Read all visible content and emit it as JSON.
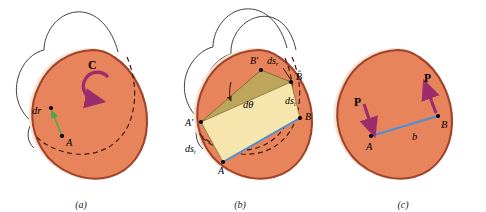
{
  "figure": {
    "background": "#ffffff"
  },
  "colors": {
    "body_fill": "#E8845C",
    "body_edge": "#A0432A",
    "body_highlight": "#F7E3D2",
    "outline_curve": "#2B2B2B",
    "dashed_curve": "#3A1A10",
    "arrow_purple": "#9B2D6F",
    "arrow_green": "#4CA64C",
    "line_blue": "#4B8FD6",
    "rect_fill": "#F7E5AE",
    "rect_fill_rotated": "#B8A85C",
    "point_black": "#000000",
    "caption_text": "#1a1a1a"
  },
  "panels": [
    {
      "id": "a",
      "caption": "(a)",
      "labels": [
        {
          "name": "rotation-label-c",
          "text": "C",
          "style": "bold",
          "x": 94,
          "y": 66
        },
        {
          "name": "dr-label",
          "text": "dr",
          "style": "italic-bold-r",
          "x": 36,
          "y": 114
        },
        {
          "name": "point-a-label",
          "text": "A",
          "style": "italic",
          "x": 68,
          "y": 140
        }
      ],
      "points": [
        {
          "name": "point-dr-tip",
          "x": 51,
          "y": 108
        },
        {
          "name": "point-a",
          "x": 62,
          "y": 136
        }
      ],
      "arrows": [
        {
          "name": "dr-vector",
          "color": "#4CA64C",
          "from": [
            62,
            136
          ],
          "to": [
            51,
            109
          ]
        },
        {
          "name": "rotation-arc-arrow",
          "color": "#9B2D6F",
          "kind": "circular-ccw"
        }
      ],
      "curves": {
        "outline_count": 1,
        "dashed_count": 1
      }
    },
    {
      "id": "b",
      "caption": "(b)",
      "labels": [
        {
          "name": "point-b-prime-label",
          "text": "B′",
          "style": "italic",
          "x": 110,
          "y": 62
        },
        {
          "name": "dsr-label",
          "text": "ds",
          "sub": "r",
          "style": "italic",
          "x": 126,
          "y": 62
        },
        {
          "name": "point-b-hat-label",
          "text": "B̂",
          "style": "italic",
          "x": 144,
          "y": 78
        },
        {
          "name": "dtheta-label",
          "text": "dθ",
          "style": "italic",
          "x": 97,
          "y": 104
        },
        {
          "name": "dst-right-label",
          "text": "ds",
          "sub": "t",
          "style": "italic",
          "x": 139,
          "y": 101
        },
        {
          "name": "point-b-label",
          "text": "B",
          "style": "italic",
          "x": 153,
          "y": 122
        },
        {
          "name": "point-a-prime-label",
          "text": "A′",
          "style": "italic",
          "x": 35,
          "y": 124
        },
        {
          "name": "dst-left-label",
          "text": "ds",
          "sub": "t",
          "style": "italic",
          "x": 37,
          "y": 149
        },
        {
          "name": "point-a-label",
          "text": "A",
          "style": "italic",
          "x": 62,
          "y": 170
        }
      ],
      "points": [
        {
          "name": "point-b-prime",
          "x": 106,
          "y": 70
        },
        {
          "name": "point-b-hat",
          "x": 136,
          "y": 82
        },
        {
          "name": "point-b",
          "x": 145,
          "y": 118
        },
        {
          "name": "point-a-prime",
          "x": 46,
          "y": 122
        },
        {
          "name": "point-a",
          "x": 68,
          "y": 162
        }
      ],
      "shapes": [
        {
          "name": "strain-rectangle",
          "fill": "#F7E5AE"
        },
        {
          "name": "rotated-parallelogram",
          "fill": "#B8A85C"
        },
        {
          "name": "baseline-blue-edge",
          "color": "#4B8FD6"
        }
      ],
      "curves": {
        "outline_count": 2,
        "dashed_count": 2
      }
    },
    {
      "id": "c",
      "caption": "(c)",
      "labels": [
        {
          "name": "traction-label-left",
          "text": "P",
          "style": "bold",
          "x": 40,
          "y": 104
        },
        {
          "name": "traction-label-right",
          "text": "P",
          "style": "bold",
          "x": 108,
          "y": 80
        },
        {
          "name": "point-a-label",
          "text": "A",
          "style": "italic",
          "x": 47,
          "y": 147
        },
        {
          "name": "segment-b-label",
          "text": "b",
          "style": "italic",
          "x": 96,
          "y": 136
        },
        {
          "name": "point-b-label",
          "text": "B",
          "style": "italic",
          "x": 124,
          "y": 126
        }
      ],
      "points": [
        {
          "name": "point-a",
          "x": 51,
          "y": 136
        },
        {
          "name": "point-b",
          "x": 118,
          "y": 116
        }
      ],
      "arrows": [
        {
          "name": "traction-vector-left",
          "color": "#9B2D6F",
          "from": [
            44,
            104
          ],
          "to": [
            52,
            131
          ]
        },
        {
          "name": "traction-vector-right",
          "color": "#9B2D6F",
          "from": [
            116,
            113
          ],
          "to": [
            106,
            86
          ]
        }
      ],
      "shapes": [
        {
          "name": "segment-ab",
          "color": "#4B8FD6"
        }
      ],
      "curves": {
        "outline_count": 0,
        "dashed_count": 0
      }
    }
  ]
}
